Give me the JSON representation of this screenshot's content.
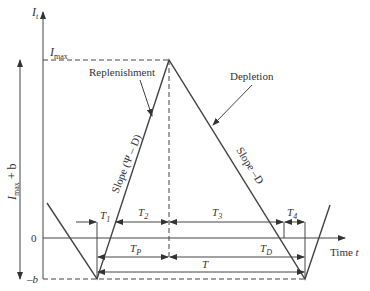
{
  "labels": {
    "y_axis": "I",
    "y_axis_sub": "t",
    "imax": "I",
    "imax_sub": "max",
    "range": "I",
    "range_sub": "max",
    "range_suffix": " + b",
    "zero": "0",
    "neg_b": "–b",
    "x_axis": "Time ",
    "x_axis_var": "t",
    "replenishment": "Replenishment",
    "depletion": "Depletion",
    "slope_up": "Slope (Ψ – D)",
    "slope_down": "Slope –D",
    "T1": "T",
    "T1_sub": "1",
    "T2": "T",
    "T2_sub": "2",
    "T3": "T",
    "T3_sub": "3",
    "T4": "T",
    "T4_sub": "4",
    "TP": "T",
    "TP_sub": "P",
    "TD": "T",
    "TD_sub": "D",
    "T": "T"
  },
  "colors": {
    "line": "#444444",
    "text": "#333333"
  }
}
